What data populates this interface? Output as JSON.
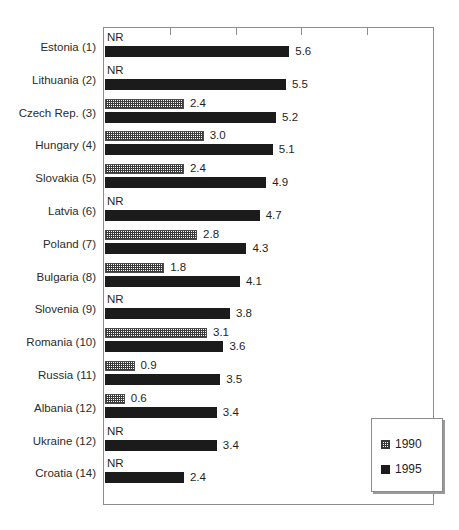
{
  "chart_data": {
    "type": "bar",
    "orientation": "horizontal",
    "title": "",
    "xlabel": "",
    "ylabel": "",
    "xlim": [
      0,
      10
    ],
    "grid": false,
    "axis_ticks_unlabeled": true,
    "legend_position": "bottom-right",
    "categories": [
      "Estonia (1)",
      "Lithuania (2)",
      "Czech Rep. (3)",
      "Hungary (4)",
      "Slovakia (5)",
      "Latvia (6)",
      "Poland (7)",
      "Bulgaria (8)",
      "Slovenia (9)",
      "Romania (10)",
      "Russia (11)",
      "Albania (12)",
      "Ukraine (12)",
      "Croatia (14)"
    ],
    "series": [
      {
        "name": "1990",
        "values": [
          null,
          null,
          2.4,
          3.0,
          2.4,
          null,
          2.8,
          1.8,
          null,
          3.1,
          0.9,
          0.6,
          null,
          null
        ],
        "labels": [
          "NR",
          "NR",
          "2.4",
          "3.0",
          "2.4",
          "NR",
          "2.8",
          "1.8",
          "NR",
          "3.1",
          "0.9",
          "0.6",
          "NR",
          "NR"
        ],
        "missing_label": "NR",
        "fill": "dotted-pattern",
        "color": "#3a3a3a"
      },
      {
        "name": "1995",
        "values": [
          5.6,
          5.5,
          5.2,
          5.1,
          4.9,
          4.7,
          4.3,
          4.1,
          3.8,
          3.6,
          3.5,
          3.4,
          3.4,
          2.4
        ],
        "labels": [
          "5.6",
          "5.5",
          "5.2",
          "5.1",
          "4.9",
          "4.7",
          "4.3",
          "4.1",
          "3.8",
          "3.6",
          "3.5",
          "3.4",
          "3.4",
          "2.4"
        ],
        "fill": "solid",
        "color": "#1b1b1b"
      }
    ]
  },
  "legend": {
    "items": [
      {
        "label": "1990",
        "swatch": "dotted-swatch"
      },
      {
        "label": "1995",
        "swatch": "solid-swatch"
      }
    ]
  },
  "axis": {
    "tick_count": 5
  },
  "title_remnant": ""
}
